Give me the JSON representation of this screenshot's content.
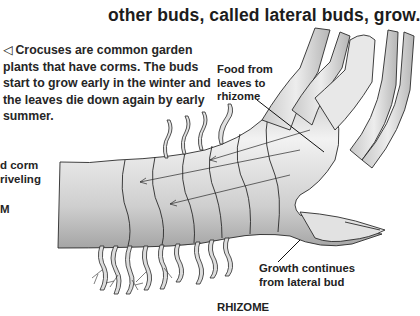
{
  "page": {
    "intro_line": "other buds, called lateral buds, grow.",
    "caption": {
      "arrow_icon": "left-triangle-arrow",
      "text": "Crocuses are common garden plants that have corms. The buds start to grow early in the winter and the leaves die down again by early summer."
    },
    "left_fragments": [
      "d corm",
      "riveling",
      "M"
    ]
  },
  "diagram": {
    "labels": {
      "food_from_leaves": [
        "Food from",
        "leaves to",
        "rhizome"
      ],
      "growth_continues": [
        "Growth continues",
        "from lateral bud"
      ],
      "title": "RHIZOME"
    },
    "colors": {
      "ink": "#1f1f1f",
      "fill_light": "#e6e6e6",
      "fill_mid": "#c8c8c8",
      "fill_dark": "#9a9a9a"
    }
  }
}
